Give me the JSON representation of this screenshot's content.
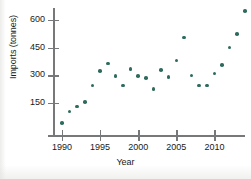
{
  "chart_data": {
    "type": "scatter",
    "title": "",
    "xlabel": "Year",
    "ylabel": "Imports (tonnes)",
    "xlim": [
      1989,
      2015
    ],
    "ylim": [
      0,
      660
    ],
    "grid": false,
    "legend": null,
    "marker_color": "#2e6b5e",
    "axis_color": "#77787a",
    "xticks": [
      1990,
      1995,
      2000,
      2005,
      2010,
      2015
    ],
    "xticklabels": [
      "1990",
      "1995",
      "2000",
      "2005",
      "2010",
      ""
    ],
    "yticks": [
      150,
      300,
      450,
      600
    ],
    "yticklabels": [
      "150",
      "300",
      "450",
      "600"
    ],
    "x": [
      1990,
      1991,
      1992,
      1993,
      1994,
      1995,
      1996,
      1997,
      1998,
      1999,
      2000,
      2001,
      2002,
      2003,
      2004,
      2005,
      2006,
      2007,
      2008,
      2009,
      2010,
      2011,
      2012,
      2013,
      2014
    ],
    "y": [
      40,
      105,
      130,
      155,
      245,
      325,
      365,
      295,
      245,
      335,
      295,
      285,
      225,
      330,
      290,
      380,
      505,
      300,
      245,
      245,
      310,
      355,
      450,
      525,
      650
    ],
    "points": [
      {
        "year": 1990,
        "value": 40
      },
      {
        "year": 1991,
        "value": 105
      },
      {
        "year": 1992,
        "value": 130
      },
      {
        "year": 1993,
        "value": 155
      },
      {
        "year": 1994,
        "value": 245
      },
      {
        "year": 1995,
        "value": 325
      },
      {
        "year": 1996,
        "value": 365
      },
      {
        "year": 1997,
        "value": 295
      },
      {
        "year": 1998,
        "value": 245
      },
      {
        "year": 1999,
        "value": 335
      },
      {
        "year": 2000,
        "value": 295
      },
      {
        "year": 2001,
        "value": 285
      },
      {
        "year": 2002,
        "value": 225
      },
      {
        "year": 2003,
        "value": 330
      },
      {
        "year": 2004,
        "value": 290
      },
      {
        "year": 2005,
        "value": 380
      },
      {
        "year": 2006,
        "value": 505
      },
      {
        "year": 2007,
        "value": 300
      },
      {
        "year": 2008,
        "value": 245
      },
      {
        "year": 2009,
        "value": 245
      },
      {
        "year": 2010,
        "value": 310
      },
      {
        "year": 2011,
        "value": 355
      },
      {
        "year": 2012,
        "value": 450
      },
      {
        "year": 2013,
        "value": 525
      },
      {
        "year": 2014,
        "value": 650
      }
    ]
  }
}
